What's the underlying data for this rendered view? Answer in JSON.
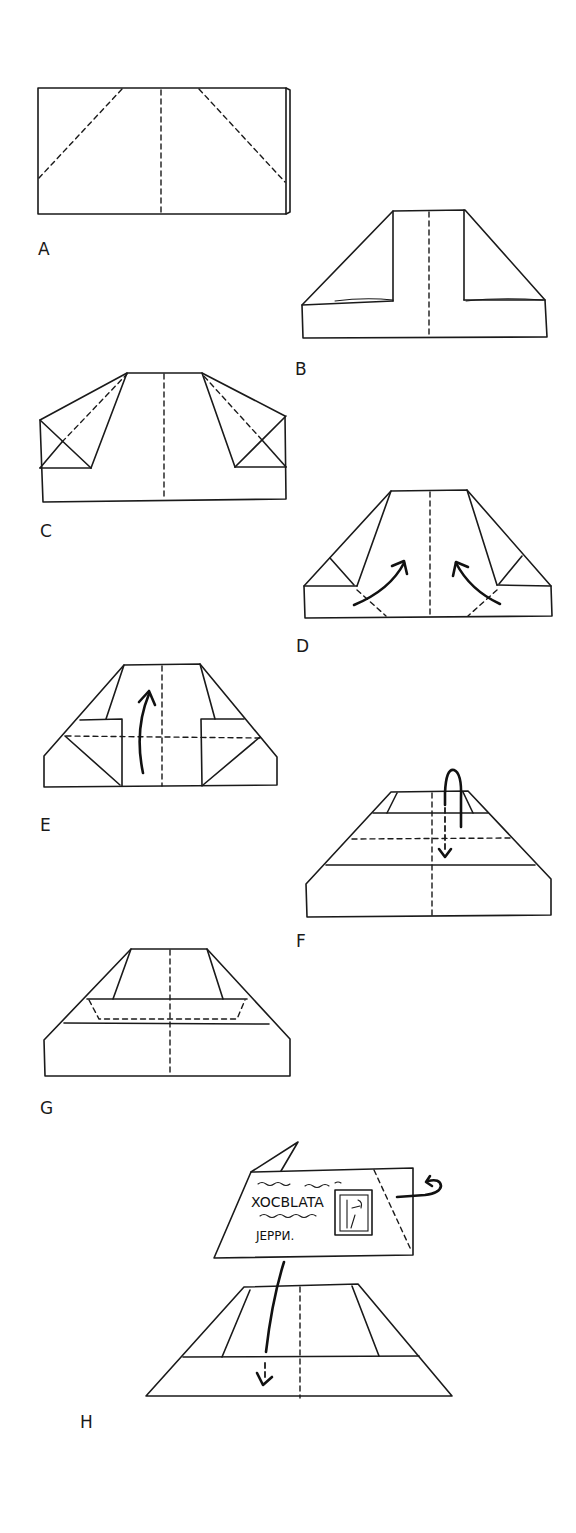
{
  "diagram": {
    "type": "origami-folding-instructions",
    "steps": [
      {
        "id": "A",
        "label": "A"
      },
      {
        "id": "B",
        "label": "B"
      },
      {
        "id": "C",
        "label": "C"
      },
      {
        "id": "D",
        "label": "D"
      },
      {
        "id": "E",
        "label": "E"
      },
      {
        "id": "F",
        "label": "F"
      },
      {
        "id": "G",
        "label": "G"
      },
      {
        "id": "H",
        "label": "H"
      }
    ],
    "postcard": {
      "line1": "XOCBLATA",
      "line2": "ЈЕРРИ."
    }
  }
}
